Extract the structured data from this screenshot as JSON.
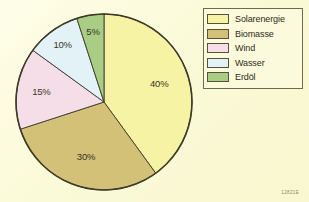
{
  "figure": {
    "background_color": "#fdfce2",
    "plate_code": "12821E"
  },
  "legend": {
    "position": "top-right",
    "items": [
      {
        "label": "Solarenergie",
        "color": "#f7f3a4"
      },
      {
        "label": "Biomasse",
        "color": "#d2c177"
      },
      {
        "label": "Wind",
        "color": "#f6dee8"
      },
      {
        "label": "Wasser",
        "color": "#e2f2f7"
      },
      {
        "label": "Erdöl",
        "color": "#a9cd84"
      }
    ]
  },
  "chart_data": {
    "type": "pie",
    "title": "",
    "xlabel": "",
    "ylabel": "",
    "start_angle_deg": 0,
    "direction": "clockwise",
    "grid": false,
    "legend_position": "top-right",
    "categories": [
      "Solarenergie",
      "Biomasse",
      "Wind",
      "Wasser",
      "Erdöl"
    ],
    "values": [
      40,
      30,
      15,
      10,
      5
    ],
    "value_unit": "%",
    "data_labels": [
      "40%",
      "30%",
      "15%",
      "10%",
      "5%"
    ],
    "colors": [
      "#f7f3a4",
      "#d2c177",
      "#f6dee8",
      "#e2f2f7",
      "#a9cd84"
    ],
    "slice_edge_color": "#3d3a2a"
  }
}
